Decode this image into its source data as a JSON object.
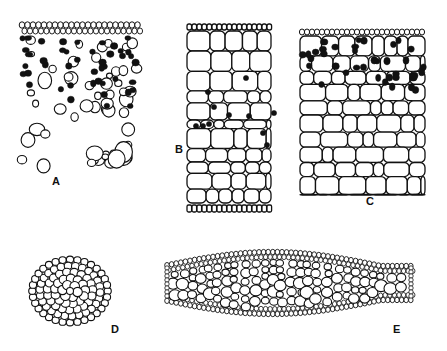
{
  "figure": {
    "panels": [
      {
        "id": "A",
        "label": "A",
        "label_pos": [
          52,
          175
        ],
        "box": [
          20,
          22,
          140,
          175
        ],
        "style": "scattered-cells-with-dark-grains"
      },
      {
        "id": "B",
        "label": "B",
        "label_pos": [
          175,
          143
        ],
        "box": [
          185,
          22,
          272,
          215
        ],
        "style": "compact-polygonal-cells-few-dark"
      },
      {
        "id": "C",
        "label": "C",
        "label_pos": [
          366,
          195
        ],
        "box": [
          298,
          28,
          425,
          200
        ],
        "style": "layered-cells-dark-grains-top"
      },
      {
        "id": "D",
        "label": "D",
        "label_pos": [
          111,
          323
        ],
        "box": [
          28,
          256,
          112,
          327
        ],
        "style": "small-oval-cross-section"
      },
      {
        "id": "E",
        "label": "E",
        "label_pos": [
          393,
          323
        ],
        "box": [
          160,
          248,
          416,
          320
        ],
        "style": "elongated-cross-section"
      }
    ],
    "colors": {
      "ink": "#111111",
      "background": "#ffffff"
    }
  }
}
